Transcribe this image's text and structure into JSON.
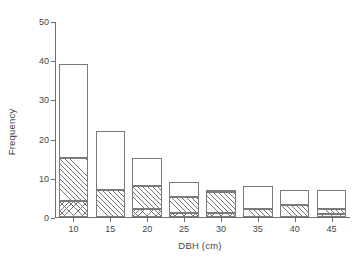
{
  "chart_data": {
    "type": "bar",
    "title": "",
    "subtitle": "",
    "xlabel": "DBH (cm)",
    "ylabel": "Frequency",
    "categories": [
      "10",
      "15",
      "20",
      "25",
      "30",
      "35",
      "40",
      "45"
    ],
    "x": [
      10,
      15,
      20,
      25,
      30,
      35,
      40,
      45
    ],
    "xtick_labels": [
      "10",
      "15",
      "20",
      "25",
      "30",
      "35",
      "40",
      "45"
    ],
    "ytick_labels": [
      "0",
      "10",
      "20",
      "30",
      "40",
      "50"
    ],
    "yticks": [
      0,
      10,
      20,
      30,
      40,
      50
    ],
    "ylim": [
      0,
      50
    ],
    "xlim": [
      7.5,
      47.5
    ],
    "grid": false,
    "legend": "none",
    "stacked": true,
    "bar_style": {
      "edge_color": "#7a7a7a",
      "fill_color": "#ffffff",
      "hatch_color": "#6e6e6e"
    },
    "series": [
      {
        "name": "crosshatch-segment",
        "pattern": "crosshatch",
        "values": [
          4,
          0,
          2,
          1,
          1,
          0,
          0,
          0.7
        ]
      },
      {
        "name": "diagonal-hatch-segment",
        "pattern": "diagonal-hatch",
        "values": [
          11,
          7,
          6,
          4,
          5.5,
          2,
          3,
          1.3
        ]
      },
      {
        "name": "open-segment",
        "pattern": "open",
        "values": [
          24,
          15,
          7,
          4,
          0.5,
          6,
          4,
          5
        ]
      }
    ],
    "totals": [
      39,
      22,
      15,
      9,
      7,
      8,
      7,
      7
    ],
    "segment_tops": [
      {
        "crosshatch_top": 4,
        "hatch_top": 15,
        "bar_top": 39
      },
      {
        "crosshatch_top": 0,
        "hatch_top": 7,
        "bar_top": 22
      },
      {
        "crosshatch_top": 2,
        "hatch_top": 8,
        "bar_top": 15
      },
      {
        "crosshatch_top": 1,
        "hatch_top": 5,
        "bar_top": 9
      },
      {
        "crosshatch_top": 1,
        "hatch_top": 6.5,
        "bar_top": 7
      },
      {
        "crosshatch_top": 0,
        "hatch_top": 2,
        "bar_top": 8
      },
      {
        "crosshatch_top": 0,
        "hatch_top": 3,
        "bar_top": 7
      },
      {
        "crosshatch_top": 0.7,
        "hatch_top": 2,
        "bar_top": 7
      }
    ]
  }
}
